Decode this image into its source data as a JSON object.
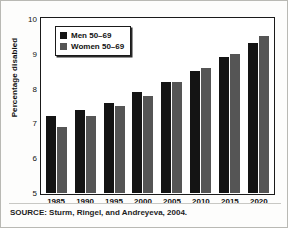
{
  "chart_data": {
    "type": "bar",
    "title": "",
    "subtitle": "",
    "xlabel": "",
    "ylabel": "Percentage disabled",
    "ylim": [
      5,
      10
    ],
    "yticks": [
      10,
      9,
      8,
      7,
      6,
      5
    ],
    "grid": false,
    "legend_position": "top-left",
    "categories": [
      "1985",
      "1990",
      "1995",
      "2000",
      "2005",
      "2010",
      "2015",
      "2020"
    ],
    "series": [
      {
        "name": "Men 50–69",
        "color": "#141414",
        "values": [
          7.2,
          7.4,
          7.6,
          7.9,
          8.2,
          8.5,
          8.9,
          9.3
        ]
      },
      {
        "name": "Women 50–69",
        "color": "#555555",
        "values": [
          6.9,
          7.2,
          7.5,
          7.8,
          8.2,
          8.6,
          9.0,
          9.5
        ]
      }
    ],
    "annotations": [
      "SOURCE: Sturm, Ringel, and Andreyeva, 2004."
    ]
  },
  "legend": {
    "items": [
      {
        "label": "Men 50–69",
        "swatch": "men-swatch"
      },
      {
        "label": "Women 50–69",
        "swatch": "women-swatch"
      }
    ]
  },
  "source": {
    "text": "SOURCE: Sturm, Ringel, and Andreyeva, 2004."
  },
  "axis": {
    "y_title": "Percentage disabled"
  }
}
